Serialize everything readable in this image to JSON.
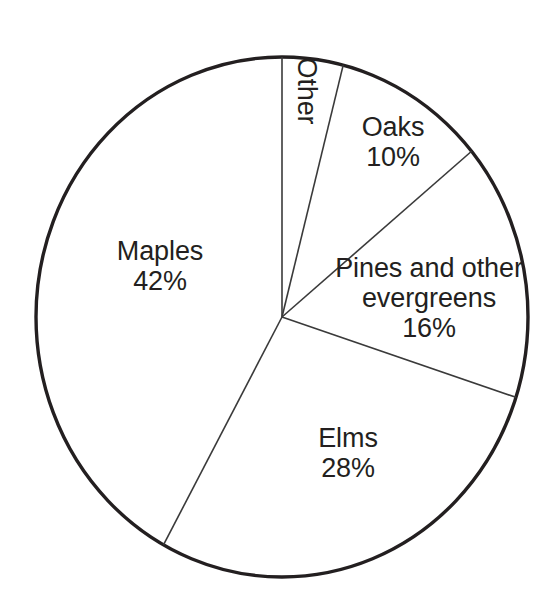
{
  "chart_data": {
    "type": "pie",
    "title": "",
    "subtitle": "",
    "xlabel": "",
    "ylabel": "",
    "legend_position": "none",
    "grid": false,
    "labels_inside": true,
    "units": "percent",
    "total": 100,
    "categories": [
      "Other",
      "Oaks",
      "Pines and other evergreens",
      "Elms",
      "Maples"
    ],
    "values": [
      4,
      10,
      16,
      28,
      42
    ],
    "start_angle_deg": 0,
    "direction": "clockwise",
    "slices": [
      {
        "id": "other",
        "label": "Other",
        "label_line1": "Other",
        "label_line2": "",
        "value": 4,
        "percent_text": "",
        "start_deg": 0,
        "end_deg": 14.4,
        "fill": "#ffffff",
        "stroke": "#3a3a3a",
        "label_rotated": true,
        "label_rotation_deg": 90
      },
      {
        "id": "oaks",
        "label": "Oaks",
        "label_line1": "Oaks",
        "label_line2": "",
        "value": 10,
        "percent_text": "10%",
        "start_deg": 14.4,
        "end_deg": 50.4,
        "fill": "#ffffff",
        "stroke": "#3a3a3a",
        "label_rotated": false,
        "label_rotation_deg": 0
      },
      {
        "id": "pines",
        "label": "Pines and other evergreens",
        "label_line1": "Pines and other",
        "label_line2": "evergreens",
        "value": 16,
        "percent_text": "16%",
        "start_deg": 50.4,
        "end_deg": 108.0,
        "fill": "#ffffff",
        "stroke": "#3a3a3a",
        "label_rotated": false,
        "label_rotation_deg": 0
      },
      {
        "id": "elms",
        "label": "Elms",
        "label_line1": "Elms",
        "label_line2": "",
        "value": 28,
        "percent_text": "28%",
        "start_deg": 108.0,
        "end_deg": 208.8,
        "fill": "#ffffff",
        "stroke": "#3a3a3a",
        "label_rotated": false,
        "label_rotation_deg": 0
      },
      {
        "id": "maples",
        "label": "Maples",
        "label_line1": "Maples",
        "label_line2": "",
        "value": 42,
        "percent_text": "42%",
        "start_deg": 208.8,
        "end_deg": 360.0,
        "fill": "#ffffff",
        "stroke": "#3a3a3a",
        "label_rotated": false,
        "label_rotation_deg": 0
      }
    ],
    "geometry": {
      "center_x": 282,
      "center_y": 317,
      "radius_x": 246,
      "radius_y": 260
    },
    "style": {
      "background": "#ffffff",
      "outline_color": "#231f20",
      "outline_width": 3.4,
      "divider_color": "#3a3a3a",
      "divider_width": 1.6,
      "text_color": "#231f20"
    }
  }
}
